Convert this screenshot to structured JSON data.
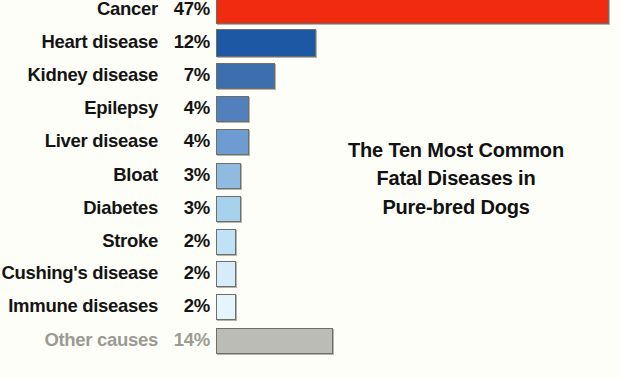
{
  "background_color": "#fefef8",
  "title": {
    "lines": [
      "The Ten Most Common",
      "Fatal Diseases in",
      "Pure-bred Dogs"
    ],
    "full": "The Ten Most Common Fatal Diseases in Pure-bred Dogs",
    "color": "#111111"
  },
  "rows": [
    {
      "label": "Cancer",
      "pct": "47%",
      "value": 47,
      "color": "#f02b10",
      "muted": false
    },
    {
      "label": "Heart disease",
      "pct": "12%",
      "value": 12,
      "color": "#1d58a5",
      "muted": false
    },
    {
      "label": "Kidney disease",
      "pct": "7%",
      "value": 7,
      "color": "#3d6ead",
      "muted": false
    },
    {
      "label": "Epilepsy",
      "pct": "4%",
      "value": 4,
      "color": "#5180bd",
      "muted": false
    },
    {
      "label": "Liver disease",
      "pct": "4%",
      "value": 4,
      "color": "#6e9bd1",
      "muted": false
    },
    {
      "label": "Bloat",
      "pct": "3%",
      "value": 3,
      "color": "#8fbbe2",
      "muted": false
    },
    {
      "label": "Diabetes",
      "pct": "3%",
      "value": 3,
      "color": "#a6d2ee",
      "muted": false
    },
    {
      "label": "Stroke",
      "pct": "2%",
      "value": 2,
      "color": "#bfe2f7",
      "muted": false
    },
    {
      "label": "Cushing's disease",
      "pct": "2%",
      "value": 2,
      "color": "#d6ecfa",
      "muted": false
    },
    {
      "label": "Immune diseases",
      "pct": "2%",
      "value": 2,
      "color": "#e6f4fd",
      "muted": false
    },
    {
      "label": "Other causes",
      "pct": "14%",
      "value": 14,
      "color": "#bcbcb6",
      "muted": true
    }
  ],
  "chart_data": {
    "type": "bar",
    "orientation": "horizontal",
    "xlabel": "",
    "ylabel": "",
    "categories": [
      "Cancer",
      "Heart disease",
      "Kidney disease",
      "Epilepsy",
      "Liver disease",
      "Bloat",
      "Diabetes",
      "Stroke",
      "Cushing's disease",
      "Immune diseases",
      "Other causes"
    ],
    "values": [
      47,
      12,
      7,
      4,
      4,
      3,
      3,
      2,
      2,
      2,
      14
    ],
    "value_labels": [
      "47%",
      "12%",
      "7%",
      "4%",
      "4%",
      "3%",
      "3%",
      "2%",
      "2%",
      "2%",
      "14%"
    ],
    "units": "percent",
    "xlim": [
      0,
      47
    ],
    "grid": false,
    "legend": "none",
    "bar_colors": [
      "#f02b10",
      "#1d58a5",
      "#3d6ead",
      "#5180bd",
      "#6e9bd1",
      "#8fbbe2",
      "#a6d2ee",
      "#bfe2f7",
      "#d6ecfa",
      "#e6f4fd",
      "#bcbcb6"
    ]
  }
}
